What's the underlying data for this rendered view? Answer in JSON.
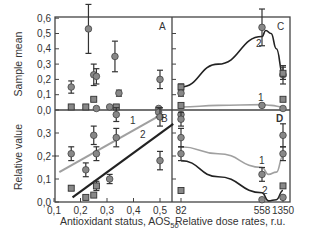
{
  "chart_data": [
    {
      "panel": "A",
      "type": "scatter",
      "ylabel": "Sample mean",
      "xlim": [
        0.1,
        0.55
      ],
      "ylim": [
        0.0,
        0.6
      ],
      "yticks": [
        "0,0",
        "0,1",
        "0,2",
        "0,3",
        "0,4",
        "0,5",
        "0,6"
      ],
      "points": [
        {
          "x": 0.165,
          "y": 0.15,
          "err": 0.04,
          "marker": "circle"
        },
        {
          "x": 0.165,
          "y": 0.02,
          "err": 0.01,
          "marker": "square"
        },
        {
          "x": 0.23,
          "y": 0.53,
          "err": 0.16,
          "marker": "circle"
        },
        {
          "x": 0.22,
          "y": 0.02,
          "err": 0.01,
          "marker": "square"
        },
        {
          "x": 0.25,
          "y": 0.23,
          "err": 0.07,
          "marker": "circle"
        },
        {
          "x": 0.26,
          "y": 0.22,
          "err": 0.05,
          "marker": "circle"
        },
        {
          "x": 0.25,
          "y": 0.07,
          "err": 0.01,
          "marker": "square"
        },
        {
          "x": 0.26,
          "y": 0.01,
          "err": 0.005,
          "marker": "circle"
        },
        {
          "x": 0.33,
          "y": 0.35,
          "err": 0.1,
          "marker": "circle"
        },
        {
          "x": 0.31,
          "y": 0.02,
          "err": 0.005,
          "marker": "circle"
        },
        {
          "x": 0.335,
          "y": 0.02,
          "err": 0.005,
          "marker": "square"
        },
        {
          "x": 0.345,
          "y": 0.11,
          "err": 0.02,
          "marker": "circle"
        },
        {
          "x": 0.5,
          "y": 0.2,
          "err": 0.06,
          "marker": "circle"
        },
        {
          "x": 0.495,
          "y": 0.01,
          "err": 0.005,
          "marker": "circle"
        }
      ],
      "annotations": [
        "A"
      ]
    },
    {
      "panel": "B",
      "type": "scatter",
      "ylabel": "Relative value",
      "xlabel": "Antioxidant status, AOS50",
      "xlim": [
        0.1,
        0.55
      ],
      "ylim": [
        0.0,
        0.4
      ],
      "xticks": [
        "0,1",
        "0,2",
        "0,3",
        "0,4",
        "0,5"
      ],
      "yticks": [
        "0,0",
        "0,1",
        "0,2",
        "0,3"
      ],
      "points": [
        {
          "x": 0.165,
          "y": 0.21,
          "err": 0.03,
          "marker": "circle"
        },
        {
          "x": 0.165,
          "y": 0.06,
          "err": 0.01,
          "marker": "square"
        },
        {
          "x": 0.22,
          "y": 0.14,
          "err": 0.03,
          "marker": "circle"
        },
        {
          "x": 0.22,
          "y": 0.02,
          "err": 0.005,
          "marker": "square"
        },
        {
          "x": 0.25,
          "y": 0.29,
          "err": 0.04,
          "marker": "circle"
        },
        {
          "x": 0.26,
          "y": 0.21,
          "err": 0.03,
          "marker": "circle"
        },
        {
          "x": 0.26,
          "y": 0.07,
          "err": 0.02,
          "marker": "square"
        },
        {
          "x": 0.25,
          "y": 0.03,
          "err": 0.005,
          "marker": "square"
        },
        {
          "x": 0.31,
          "y": 0.1,
          "err": 0.02,
          "marker": "circle"
        },
        {
          "x": 0.335,
          "y": 0.28,
          "err": 0.04,
          "marker": "circle"
        },
        {
          "x": 0.335,
          "y": 0.38,
          "err": 0.03,
          "marker": "circle"
        },
        {
          "x": 0.495,
          "y": 0.39,
          "err": 0.02,
          "marker": "circle"
        },
        {
          "x": 0.5,
          "y": 0.37,
          "err": 0.04,
          "marker": "circle"
        },
        {
          "x": 0.5,
          "y": 0.18,
          "err": 0.04,
          "marker": "circle"
        }
      ],
      "lines": [
        {
          "name": "1",
          "color": "#a0a0a0",
          "x": [
            0.12,
            0.49
          ],
          "y": [
            0.13,
            0.37
          ]
        },
        {
          "name": "2",
          "color": "#222222",
          "x": [
            0.17,
            0.55
          ],
          "y": [
            0.02,
            0.34
          ]
        }
      ],
      "annotations": [
        "B"
      ]
    },
    {
      "panel": "C",
      "type": "line",
      "xlim": [
        82,
        1350
      ],
      "xscale": "categorical-positions",
      "points": [
        {
          "x": 82,
          "y": 0.15,
          "err": 0.02,
          "marker": "square"
        },
        {
          "x": 82,
          "y": 0.11,
          "err": 0.02,
          "marker": "circle"
        },
        {
          "x": 82,
          "y": 0.03,
          "err": 0.01,
          "marker": "square"
        },
        {
          "x": 82,
          "y": -0.03,
          "err": 0.01,
          "marker": "circle"
        },
        {
          "x": 558,
          "y": 0.54,
          "err": 0.12,
          "marker": "circle"
        },
        {
          "x": 558,
          "y": 0.03,
          "err": 0.01,
          "marker": "circle"
        },
        {
          "x": 1350,
          "y": 0.23,
          "err": 0.06,
          "marker": "circle"
        },
        {
          "x": 1350,
          "y": 0.24,
          "err": 0.04,
          "marker": "square"
        },
        {
          "x": 1350,
          "y": 0.07,
          "err": 0.01,
          "marker": "square"
        },
        {
          "x": 1350,
          "y": 0.01,
          "err": 0.005,
          "marker": "circle"
        }
      ],
      "series": [
        {
          "name": "1",
          "color": "#a0a0a0",
          "x": [
            82,
            300,
            558,
            900,
            1350
          ],
          "y": [
            0.02,
            0.03,
            0.035,
            0.03,
            0.02
          ]
        },
        {
          "name": "2",
          "color": "#222222",
          "x": [
            82,
            300,
            558,
            700,
            900,
            1100,
            1350
          ],
          "y": [
            0.15,
            0.3,
            0.48,
            0.52,
            0.5,
            0.4,
            0.23
          ]
        }
      ],
      "annotations": [
        "C"
      ]
    },
    {
      "panel": "D",
      "type": "line",
      "xlabel": "Relative dose rates, r.u.",
      "xticks": [
        "82",
        "558",
        "1350"
      ],
      "points": [
        {
          "x": 82,
          "y": 0.36,
          "err": 0.03,
          "marker": "circle"
        },
        {
          "x": 82,
          "y": 0.28,
          "err": 0.04,
          "marker": "circle"
        },
        {
          "x": 82,
          "y": 0.21,
          "err": 0.03,
          "marker": "circle"
        },
        {
          "x": 82,
          "y": 0.05,
          "err": 0.005,
          "marker": "square"
        },
        {
          "x": 558,
          "y": 0.12,
          "err": 0.03,
          "marker": "circle"
        },
        {
          "x": 558,
          "y": 0.01,
          "err": 0.005,
          "marker": "circle"
        },
        {
          "x": 1350,
          "y": 0.29,
          "err": 0.05,
          "marker": "circle"
        },
        {
          "x": 1350,
          "y": 0.21,
          "err": 0.03,
          "marker": "circle"
        },
        {
          "x": 1350,
          "y": 0.07,
          "err": 0.01,
          "marker": "square"
        },
        {
          "x": 1350,
          "y": 0.02,
          "err": 0.005,
          "marker": "circle"
        }
      ],
      "series": [
        {
          "name": "1",
          "color": "#a0a0a0",
          "x": [
            82,
            300,
            558,
            800,
            1100,
            1350
          ],
          "y": [
            0.24,
            0.21,
            0.15,
            0.12,
            0.13,
            0.2
          ]
        },
        {
          "name": "2",
          "color": "#222222",
          "x": [
            82,
            300,
            558,
            800,
            1100,
            1350
          ],
          "y": [
            0.18,
            0.11,
            0.04,
            0.005,
            0.01,
            0.05
          ]
        }
      ],
      "annotations": [
        "D"
      ]
    }
  ],
  "labels": {
    "ylabel_top": "Sample mean",
    "ylabel_bottom": "Relative value",
    "xlabel_left": "Antioxidant status, AOS",
    "xlabel_left_sub": "50",
    "xlabel_right": "Relative dose rates, r.u.",
    "panel_a": "A",
    "panel_b": "B",
    "panel_c": "C",
    "panel_d": "D",
    "curve_1": "1",
    "curve_2": "2"
  },
  "ticks": {
    "a_y": [
      "0,0",
      "0,1",
      "0,2",
      "0,3",
      "0,4",
      "0,5",
      "0,6"
    ],
    "b_y": [
      "0,0",
      "0,1",
      "0,2",
      "0,3"
    ],
    "left_x": [
      "0,1",
      "0,2",
      "0,3",
      "0,4",
      "0,5"
    ],
    "right_x": [
      "82",
      "558",
      "1350"
    ]
  }
}
